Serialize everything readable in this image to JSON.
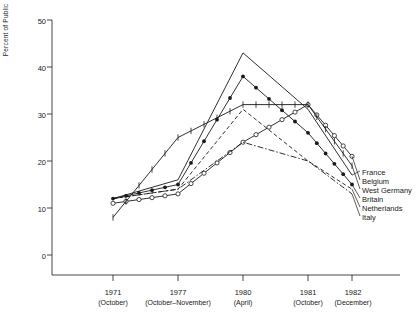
{
  "chart_data": {
    "type": "line",
    "title": "",
    "xlabel": "",
    "ylabel": "Percent of Public",
    "ylim": [
      0,
      50
    ],
    "yticks": [
      0,
      10,
      20,
      30,
      40,
      50
    ],
    "grid": false,
    "legend_position": "right",
    "categories": [
      "1971",
      "1977",
      "1980",
      "1981",
      "1982"
    ],
    "category_sublabels": [
      "(October)",
      "(October–November)",
      "(April)",
      "(October)",
      "(December)"
    ],
    "x": [
      "1971 (October)",
      "1977 (October–November)",
      "1980 (April)",
      "1981 (October)",
      "1982 (December)"
    ],
    "series": [
      {
        "name": "France",
        "marker": "none",
        "dash": "solid",
        "values": [
          12,
          16,
          43,
          31,
          17
        ]
      },
      {
        "name": "Belgium",
        "marker": "open-circle",
        "dash": "solid",
        "values": [
          11,
          13,
          24,
          32,
          21
        ]
      },
      {
        "name": "West Germany",
        "marker": "cross-tick",
        "dash": "solid",
        "values": [
          8,
          25,
          32,
          32,
          19
        ]
      },
      {
        "name": "Britain",
        "marker": "filled-circle",
        "dash": "solid",
        "values": [
          12,
          15,
          38,
          26,
          15
        ]
      },
      {
        "name": "Netherlands",
        "marker": "none",
        "dash": "dashed",
        "values": [
          12,
          14,
          31,
          20,
          14
        ]
      },
      {
        "name": "Italy",
        "marker": "none",
        "dash": "dash-dot",
        "values": [
          12,
          14,
          24,
          20,
          13
        ]
      }
    ]
  },
  "axis": {
    "ylabel": "Percent of Public",
    "ytick_labels": [
      "0",
      "10",
      "20",
      "30",
      "40",
      "50"
    ]
  },
  "legend": {
    "items": [
      {
        "label": "France"
      },
      {
        "label": "Belgium"
      },
      {
        "label": "West Germany"
      },
      {
        "label": "Britain"
      },
      {
        "label": "Netherlands"
      },
      {
        "label": "Italy"
      }
    ]
  },
  "xaxis": {
    "ticks": [
      {
        "year": "1971",
        "sub": "(October)"
      },
      {
        "year": "1977",
        "sub": "(October–November)"
      },
      {
        "year": "1980",
        "sub": "(April)"
      },
      {
        "year": "1981",
        "sub": "(October)"
      },
      {
        "year": "1982",
        "sub": "(December)"
      }
    ]
  },
  "colors": {
    "ink": "#1a1a1a",
    "background": "#ffffff"
  }
}
